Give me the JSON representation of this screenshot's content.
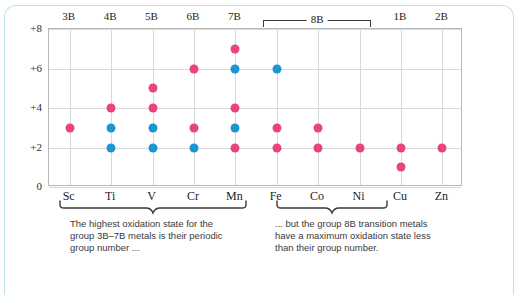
{
  "chart_data": {
    "type": "scatter",
    "title": "",
    "xlabel": "",
    "ylabel": "",
    "ylim": [
      0,
      8
    ],
    "yticks": [
      "0",
      "+2",
      "+4",
      "+6",
      "+8"
    ],
    "grid": true,
    "legend": "none",
    "categories": [
      "Sc",
      "Ti",
      "V",
      "Cr",
      "Mn",
      "Fe",
      "Co",
      "Ni",
      "Cu",
      "Zn"
    ],
    "group_labels": [
      "3B",
      "4B",
      "5B",
      "6B",
      "7B",
      "8B",
      "8B",
      "8B",
      "1B",
      "2B"
    ],
    "top_axis_labels": [
      {
        "label": "3B",
        "element": "Sc"
      },
      {
        "label": "4B",
        "element": "Ti"
      },
      {
        "label": "5B",
        "element": "V"
      },
      {
        "label": "6B",
        "element": "Cr"
      },
      {
        "label": "7B",
        "element": "Mn"
      },
      {
        "label": "1B",
        "element": "Cu"
      },
      {
        "label": "2B",
        "element": "Zn"
      }
    ],
    "bracket_8b": {
      "label": "8B",
      "spans": [
        "Fe",
        "Co",
        "Ni"
      ]
    },
    "colors": {
      "common": "#e8447e",
      "highlight": "#1b96d4"
    },
    "series": [
      {
        "name": "common oxidation state",
        "color": "#e8447e",
        "points": [
          {
            "element": "Sc",
            "value": 3
          },
          {
            "element": "Ti",
            "value": 4
          },
          {
            "element": "V",
            "value": 5
          },
          {
            "element": "V",
            "value": 4
          },
          {
            "element": "Cr",
            "value": 6
          },
          {
            "element": "Cr",
            "value": 3
          },
          {
            "element": "Mn",
            "value": 7
          },
          {
            "element": "Mn",
            "value": 4
          },
          {
            "element": "Mn",
            "value": 2
          },
          {
            "element": "Fe",
            "value": 3
          },
          {
            "element": "Fe",
            "value": 2
          },
          {
            "element": "Co",
            "value": 3
          },
          {
            "element": "Co",
            "value": 2
          },
          {
            "element": "Ni",
            "value": 2
          },
          {
            "element": "Cu",
            "value": 2
          },
          {
            "element": "Cu",
            "value": 1
          },
          {
            "element": "Zn",
            "value": 2
          }
        ]
      },
      {
        "name": "highlighted oxidation state",
        "color": "#1b96d4",
        "points": [
          {
            "element": "Ti",
            "value": 3
          },
          {
            "element": "Ti",
            "value": 2
          },
          {
            "element": "V",
            "value": 3
          },
          {
            "element": "V",
            "value": 2
          },
          {
            "element": "Cr",
            "value": 2
          },
          {
            "element": "Mn",
            "value": 6
          },
          {
            "element": "Mn",
            "value": 3
          },
          {
            "element": "Fe",
            "value": 6
          }
        ]
      }
    ],
    "annotations": [
      {
        "id": "left-caption",
        "text": "The highest oxidation state for the group 3B–7B metals is their periodic group number …",
        "lines": [
          "The highest oxidation state for the",
          "group 3B–7B metals is their periodic",
          "group number ..."
        ],
        "brace_over": [
          "Sc",
          "Ti",
          "V",
          "Cr",
          "Mn"
        ]
      },
      {
        "id": "right-caption",
        "text": "… but the group 8B transition metals have a maximum oxidation state less than their group number.",
        "lines": [
          "... but the group 8B transition metals",
          "have a maximum oxidation state less",
          "than their group number."
        ],
        "brace_over": [
          "Fe",
          "Co",
          "Ni"
        ]
      }
    ]
  },
  "frame": {
    "border_color": "#bfe0ef"
  }
}
